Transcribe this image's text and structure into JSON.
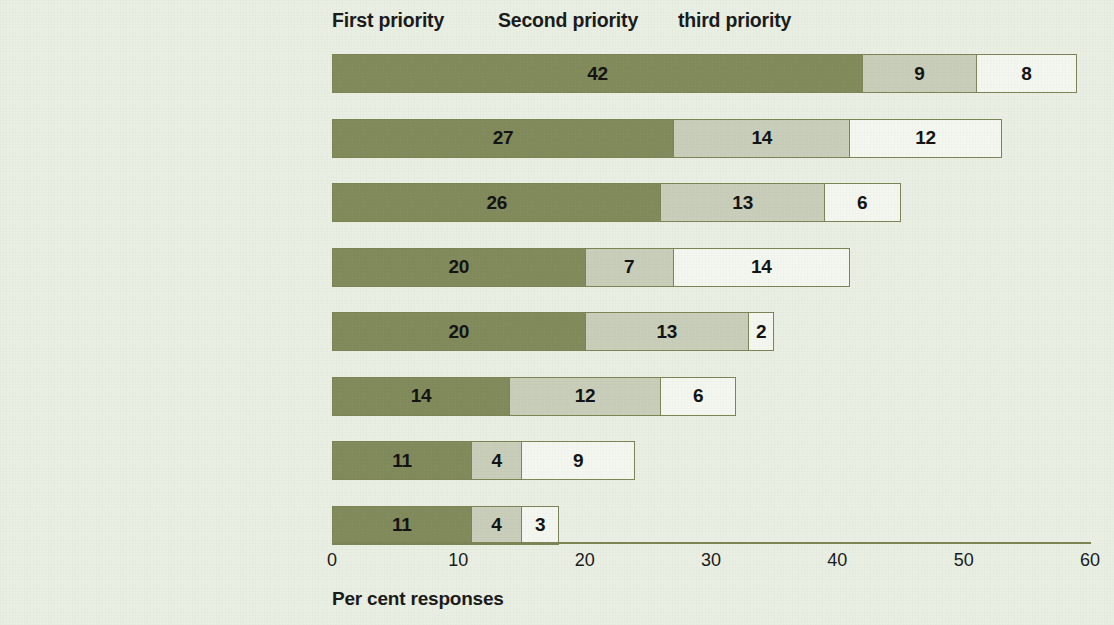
{
  "chart_data": {
    "type": "bar",
    "orientation": "horizontal",
    "stacked": true,
    "title": "",
    "xlabel": "Per cent responses",
    "ylabel": "",
    "xlim": [
      0,
      60
    ],
    "xticks": [
      0,
      10,
      20,
      30,
      40,
      50,
      60
    ],
    "xtick_labels": [
      "0",
      "10",
      "20",
      "30",
      "40",
      "50",
      "60"
    ],
    "grid": false,
    "legend_position": "top",
    "legend": [
      "First priority",
      "Second priority",
      "third priority"
    ],
    "categories": [
      "Eradicate extreme poverty and hunger",
      "Promote gender equality and empower",
      "Develop a global partnership for development",
      "Combat HIV/AIDS malaria and other diseases",
      "Ensure environmental sustainability",
      "Achieve universal primary education",
      "Improve maternal health",
      "Reduce child mortality"
    ],
    "series": [
      {
        "name": "First priority",
        "color": "#828b5c",
        "values": [
          42,
          27,
          26,
          20,
          20,
          14,
          11,
          11
        ]
      },
      {
        "name": "Second priority",
        "color": "#c8ceba",
        "values": [
          9,
          14,
          13,
          7,
          13,
          12,
          4,
          4
        ]
      },
      {
        "name": "third priority",
        "color": "#f3f7ef",
        "values": [
          8,
          12,
          6,
          14,
          2,
          6,
          9,
          3
        ]
      }
    ],
    "colors": {
      "background": "#e9efe3",
      "first_priority": "#828b5c",
      "second_priority": "#c8ceba",
      "third_priority": "#f3f7ef",
      "border": "#7d8557",
      "text": "#1b1b1b"
    }
  }
}
